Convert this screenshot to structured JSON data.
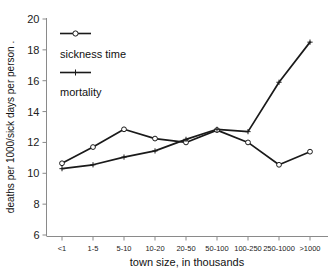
{
  "chart_data": {
    "type": "line",
    "title": "",
    "xlabel": "town size, in thousands",
    "ylabel": "deaths per 1000/sick days per person",
    "categories": [
      "<1",
      "1-5",
      "5-10",
      "10-20",
      "20-50",
      "50-100",
      "100-250",
      "250-1000",
      ">1000"
    ],
    "ylim": [
      6,
      20
    ],
    "yticks": [
      6,
      8,
      10,
      12,
      14,
      16,
      18,
      20
    ],
    "ytick_labels": [
      "6",
      "8",
      "10",
      "12",
      "14",
      "16",
      "18",
      "20"
    ],
    "grid": false,
    "legend_position": "upper-left-inside",
    "series": [
      {
        "name": "sickness time",
        "marker": "open-circle",
        "color": "#1a1a1a",
        "values": [
          10.65,
          11.7,
          12.85,
          12.25,
          12.0,
          12.8,
          12.0,
          10.55,
          11.4
        ]
      },
      {
        "name": "mortality",
        "marker": "plus",
        "color": "#1a1a1a",
        "values": [
          10.3,
          10.55,
          11.05,
          11.45,
          12.2,
          12.85,
          12.7,
          15.9,
          18.5
        ]
      }
    ]
  },
  "legend": {
    "entries": [
      {
        "label": "sickness time"
      },
      {
        "label": "mortality"
      }
    ]
  },
  "axes": {
    "x_title": "town size, in thousands",
    "y_title": "deaths per 1000/sick days per person ."
  }
}
